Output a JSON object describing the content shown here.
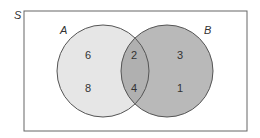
{
  "diagram": {
    "type": "venn",
    "universe_label": "S",
    "sets": [
      {
        "name": "A",
        "fill": "#e6e6e6"
      },
      {
        "name": "B",
        "fill": "#b8b8b8"
      }
    ],
    "intersection_fill": "#b0b0b0",
    "regions": {
      "a_only": [
        "6",
        "8"
      ],
      "a_and_b": [
        "2",
        "4"
      ],
      "b_only": [
        "3",
        "1"
      ]
    },
    "colors": {
      "border": "#555555",
      "circle_stroke": "#555555"
    }
  }
}
